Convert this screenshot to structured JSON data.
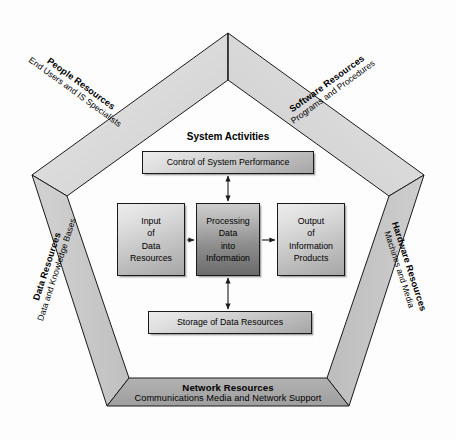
{
  "diagram": {
    "inner_heading": "System Activities",
    "edges": [
      {
        "id": "people",
        "title": "People Resources",
        "subtitle": "End Users and IS Specialists"
      },
      {
        "id": "software",
        "title": "Software Resources",
        "subtitle": "Programs and Procedures"
      },
      {
        "id": "data",
        "title": "Data Resources",
        "subtitle": "Data and Knowledge Bases"
      },
      {
        "id": "hardware",
        "title": "Hardware Resources",
        "subtitle": "Machines and Media"
      },
      {
        "id": "network",
        "title": "Network Resources",
        "subtitle": "Communications Media and Network Support"
      }
    ],
    "boxes": {
      "control": "Control of System Performance",
      "storage": "Storage of Data Resources",
      "input": {
        "line1": "Input",
        "line2": "of",
        "line3": "Data",
        "line4": "Resources"
      },
      "process": {
        "line1": "Processing",
        "line2": "Data",
        "line3": "into",
        "line4": "Information"
      },
      "output": {
        "line1": "Output",
        "line2": "of",
        "line3": "Information",
        "line4": "Products"
      }
    },
    "colors": {
      "band_light": "#d9d9d9",
      "band_mid": "#c9c9c9",
      "band_dark": "#a8a8a8",
      "outline": "#1a1a1a",
      "box_light_top": "#ededed",
      "box_light_bottom": "#a6a6a6",
      "box_dark_top": "#cfcfcf",
      "box_dark_bottom": "#6a6a6a",
      "background": "#fdfdfd"
    }
  }
}
